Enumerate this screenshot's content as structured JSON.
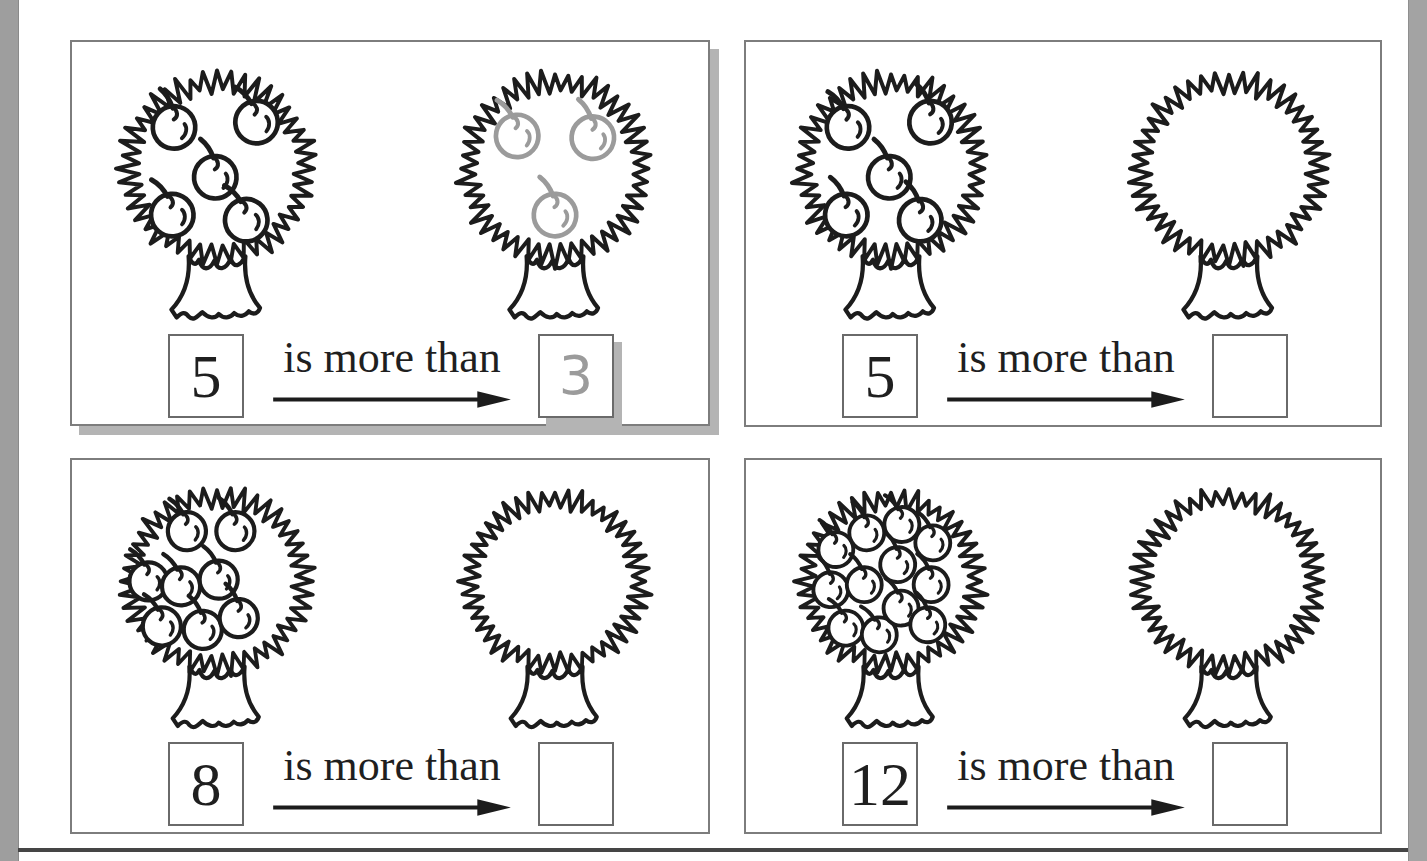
{
  "colors": {
    "ink": "#1c1c1c",
    "gray": "#9b9b9b",
    "panel_border": "#7d7d7d",
    "panel_shadow": "#b4b4b4",
    "box_border": "#6a6a6a",
    "left_strip": "#9e9e9e",
    "right_strip": "#a3a3a3",
    "bottom_rule": "#454545",
    "text": "#1f1f1f"
  },
  "panels": [
    {
      "role": "example",
      "label": "is more than",
      "left_value": "5",
      "left_apples": 5,
      "right_value": "3",
      "right_apples": 3,
      "right_apples_gray": true
    },
    {
      "role": "exercise",
      "label": "is more than",
      "left_value": "5",
      "left_apples": 5,
      "right_value": "",
      "right_apples": 0,
      "right_apples_gray": false
    },
    {
      "role": "exercise",
      "label": "is more than",
      "left_value": "8",
      "left_apples": 8,
      "right_value": "",
      "right_apples": 0,
      "right_apples_gray": false
    },
    {
      "role": "exercise",
      "label": "is more than",
      "left_value": "12",
      "left_apples": 12,
      "right_value": "",
      "right_apples": 0,
      "right_apples_gray": false
    }
  ]
}
